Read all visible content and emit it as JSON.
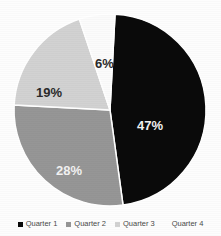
{
  "chart_data": {
    "type": "pie",
    "title": "",
    "subtitle": "",
    "xlabel": "",
    "ylabel": "",
    "grid": false,
    "legend_position": "bottom",
    "start_angle_deg": 3,
    "direction": "clockwise",
    "categories": [
      "Quarter 1",
      "Quarter 2",
      "Quarter 3",
      "Quarter 4"
    ],
    "values": [
      47,
      28,
      19,
      6
    ],
    "value_labels": [
      "47%",
      "28%",
      "19%",
      "6%"
    ],
    "colors": [
      "#0a0a0a",
      "#969696",
      "#d2d2d2",
      "#fbfbfb"
    ],
    "label_text_colors": [
      "#f2f2f2",
      "#f2f2f2",
      "#2b2b2b",
      "#2b2b2b"
    ],
    "slices": [
      {
        "name": "Quarter 1",
        "value": 47,
        "label": "47%",
        "color": "#0a0a0a",
        "label_color": "#f2f2f2"
      },
      {
        "name": "Quarter 2",
        "value": 28,
        "label": "28%",
        "color": "#969696",
        "label_color": "#f2f2f2"
      },
      {
        "name": "Quarter 3",
        "value": 19,
        "label": "19%",
        "color": "#d2d2d2",
        "label_color": "#2b2b2b"
      },
      {
        "name": "Quarter 4",
        "value": 6,
        "label": "6%",
        "color": "#fbfbfb",
        "label_color": "#2b2b2b"
      }
    ]
  },
  "legend": {
    "items": [
      {
        "label": "Quarter 1",
        "color": "#0a0a0a"
      },
      {
        "label": "Quarter 2",
        "color": "#969696"
      },
      {
        "label": "Quarter 3",
        "color": "#d2d2d2"
      },
      {
        "label": "Quarter 4",
        "color": "#fdfdfd"
      }
    ]
  },
  "style": {
    "background": "#fdfdfd",
    "slice_border": "#ffffff",
    "legend_text_color": "#4a4a4a"
  }
}
